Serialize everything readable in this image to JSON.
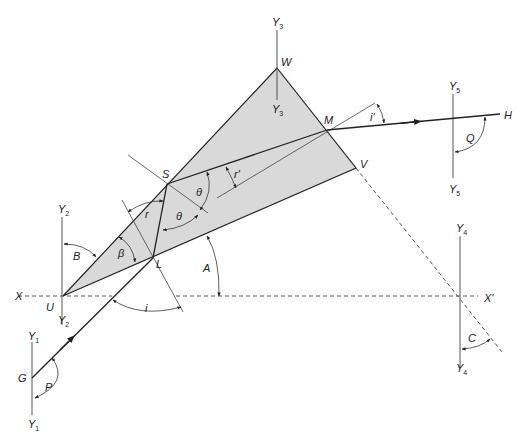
{
  "diagram": {
    "points": {
      "W": "W",
      "M": "M",
      "V": "V",
      "S": "S",
      "L": "L",
      "U": "U",
      "G": "G",
      "H": "H",
      "X": "X",
      "X_prime": "X'"
    },
    "axes": {
      "Y1": {
        "letter": "Y",
        "sub": "1"
      },
      "Y2": {
        "letter": "Y",
        "sub": "2"
      },
      "Y3": {
        "letter": "Y",
        "sub": "3"
      },
      "Y4": {
        "letter": "Y",
        "sub": "4"
      },
      "Y5": {
        "letter": "Y",
        "sub": "5"
      }
    },
    "angles": {
      "i": "i",
      "i_prime": "i'",
      "r": "r",
      "r_prime": "r'",
      "theta1": "θ",
      "theta2": "θ",
      "beta": "β",
      "A": "A",
      "B": "B",
      "C": "C",
      "P": "P",
      "Q": "Q"
    },
    "colors": {
      "prism_fill": "#d9d9d9",
      "line": "#222222"
    }
  }
}
